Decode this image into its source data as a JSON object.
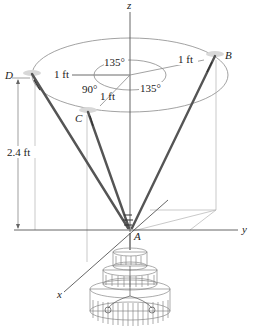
{
  "figure": {
    "type": "3D statics diagram",
    "axes": {
      "z_label": "z",
      "y_label": "y",
      "x_label": "x"
    },
    "points": {
      "A": "A",
      "B": "B",
      "C": "C",
      "D": "D"
    },
    "dimensions": {
      "radius_D": "1 ft",
      "radius_B": "1 ft",
      "radius_C": "1 ft",
      "height": "2.4 ft"
    },
    "angles": {
      "angle_DB": "135°",
      "angle_BC": "135°",
      "angle_CD": "90°"
    }
  }
}
